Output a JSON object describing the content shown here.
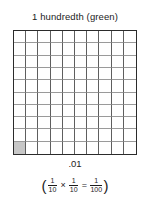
{
  "figure": {
    "title": "1 hundredth (green)",
    "decimal_label": ".01",
    "equation": {
      "open_paren": "(",
      "close_paren": ")",
      "multiply_symbol": "×",
      "equals_symbol": "=",
      "terms": [
        {
          "numerator": "1",
          "denominator": "10"
        },
        {
          "numerator": "1",
          "denominator": "10"
        },
        {
          "numerator": "1",
          "denominator": "100"
        }
      ]
    },
    "grid": {
      "rows": 10,
      "columns": 10,
      "total_cells": 100,
      "shaded_cells": 1,
      "shaded_positions": [
        {
          "row": 10,
          "column": 1
        }
      ],
      "shaded_color": "#c7c7c7",
      "border_color": "#2b2b2b",
      "vertical_line_color": "#5e5e5e",
      "horizontal_line_color": "#9a9a9a",
      "background_color": "#ffffff"
    }
  }
}
